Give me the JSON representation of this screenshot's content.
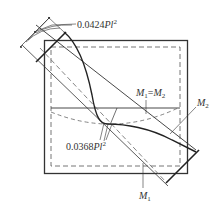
{
  "diagram": {
    "type": "plate-moment-distribution",
    "labels": {
      "top_moment": {
        "value": "0.0424",
        "var": "Pl",
        "exp": "2"
      },
      "center_moment": {
        "value": "0.0368",
        "var": "Pl",
        "exp": "2"
      },
      "equal_line": {
        "m1": "M",
        "s1": "1",
        "eq": "=",
        "m2": "M",
        "s2": "2"
      },
      "m2_curve": {
        "m": "M",
        "s": "2"
      },
      "m1_curve": {
        "m": "M",
        "s": "1"
      }
    },
    "colors": {
      "line": "#222222",
      "dashed": "#555555",
      "text": "#333333",
      "background": "#ffffff"
    }
  }
}
